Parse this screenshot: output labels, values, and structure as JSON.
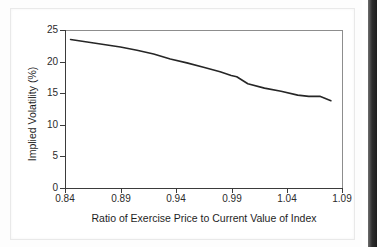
{
  "figure": {
    "background_color": "#ffffff",
    "frame_border_color": "#e9e9e9",
    "page_edge_color": "#1d1d1d"
  },
  "chart_data": {
    "type": "line",
    "title": "",
    "subtitle": "",
    "xlabel": "Ratio of Exercise Price to Current Value of Index",
    "ylabel": "Implied Volatility (%)",
    "xlim": [
      0.84,
      1.09
    ],
    "ylim": [
      0,
      25
    ],
    "grid": false,
    "legend": null,
    "xticks": [
      0.84,
      0.89,
      0.94,
      0.99,
      1.04,
      1.09
    ],
    "xtick_labels": [
      "0.84",
      "0.89",
      "0.94",
      "0.99",
      "1.04",
      "1.09"
    ],
    "yticks": [
      0,
      5,
      10,
      15,
      20,
      25
    ],
    "ytick_labels": [
      "0",
      "5",
      "10",
      "15",
      "20",
      "25"
    ],
    "line_color": "#262626",
    "line_width": 1.6,
    "series": [
      {
        "name": "Implied volatility skew",
        "x": [
          0.845,
          0.86,
          0.875,
          0.89,
          0.905,
          0.92,
          0.935,
          0.95,
          0.965,
          0.98,
          0.99,
          0.995,
          1.005,
          1.02,
          1.035,
          1.05,
          1.06,
          1.07,
          1.08
        ],
        "values": [
          23.5,
          23.1,
          22.7,
          22.3,
          21.8,
          21.2,
          20.4,
          19.8,
          19.1,
          18.4,
          17.8,
          17.6,
          16.5,
          15.8,
          15.3,
          14.7,
          14.5,
          14.5,
          13.8
        ]
      }
    ]
  }
}
